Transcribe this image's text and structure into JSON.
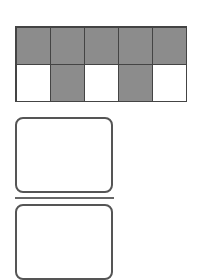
{
  "grid": {
    "rows": 2,
    "columns": 5,
    "cells": [
      [
        "shaded",
        "shaded",
        "shaded",
        "shaded",
        "shaded"
      ],
      [
        "empty",
        "shaded",
        "empty",
        "shaded",
        "empty"
      ]
    ],
    "shaded_count": 7,
    "total_count": 10,
    "shade_color": "#8c8c8c"
  },
  "answer_boxes": [
    {
      "label": "",
      "value": ""
    },
    {
      "label": "",
      "value": ""
    }
  ],
  "divider": {
    "type": "fraction-bar"
  }
}
